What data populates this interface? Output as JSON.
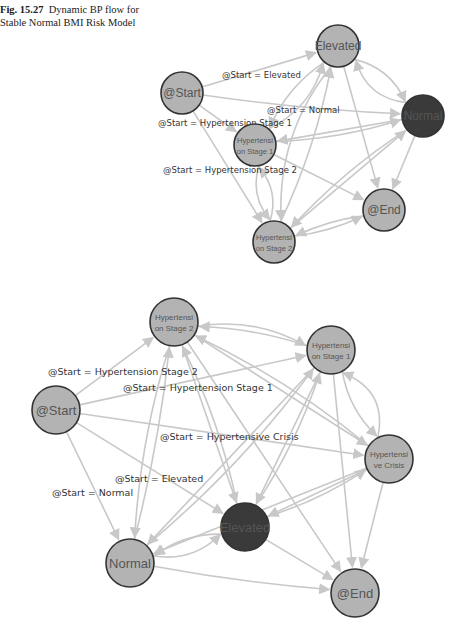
{
  "caption": {
    "figure_label": "Fig. 15.27",
    "text": "Dynamic BP flow for Stable Normal BMI Risk Model"
  },
  "colors": {
    "node_fill": "#b3b3b3",
    "node_highlight_fill": "#3a3a3a",
    "node_stroke": "#333333",
    "edge": "#c8c8c8",
    "label_text": "#333333"
  },
  "graphs": [
    {
      "id": "top",
      "nodes": [
        {
          "id": "start",
          "lines": [
            "@Start"
          ],
          "highlight": false
        },
        {
          "id": "elevated",
          "lines": [
            "Elevated"
          ],
          "highlight": false
        },
        {
          "id": "normal",
          "lines": [
            "Normal"
          ],
          "highlight": true
        },
        {
          "id": "ht1",
          "lines": [
            "Hypertensi",
            "on Stage 1"
          ],
          "highlight": false
        },
        {
          "id": "ht2",
          "lines": [
            "Hypertensi",
            "on Stage 2"
          ],
          "highlight": false
        },
        {
          "id": "end",
          "lines": [
            "@End"
          ],
          "highlight": false
        }
      ],
      "edge_labels": [
        "@Start = Elevated",
        "@Start = Normal",
        "@Start = Hypertension Stage 1",
        "@Start = Hypertension Stage 2"
      ]
    },
    {
      "id": "bottom",
      "nodes": [
        {
          "id": "ht2",
          "lines": [
            "Hypertensi",
            "on Stage 2"
          ],
          "highlight": false
        },
        {
          "id": "ht1",
          "lines": [
            "Hypertensi",
            "on Stage 1"
          ],
          "highlight": false
        },
        {
          "id": "start",
          "lines": [
            "@Start"
          ],
          "highlight": false
        },
        {
          "id": "crisis",
          "lines": [
            "Hypertensi",
            "ve Crisis"
          ],
          "highlight": false
        },
        {
          "id": "elevated",
          "lines": [
            "Elevated"
          ],
          "highlight": true
        },
        {
          "id": "normal",
          "lines": [
            "Normal"
          ],
          "highlight": false
        },
        {
          "id": "end",
          "lines": [
            "@End"
          ],
          "highlight": false
        }
      ],
      "edge_labels": [
        "@Start = Hypertension Stage 2",
        "@Start = Hypertension Stage 1",
        "@Start = Hypertensive Crisis",
        "@Start = Elevated",
        "@Start = Normal"
      ]
    }
  ]
}
